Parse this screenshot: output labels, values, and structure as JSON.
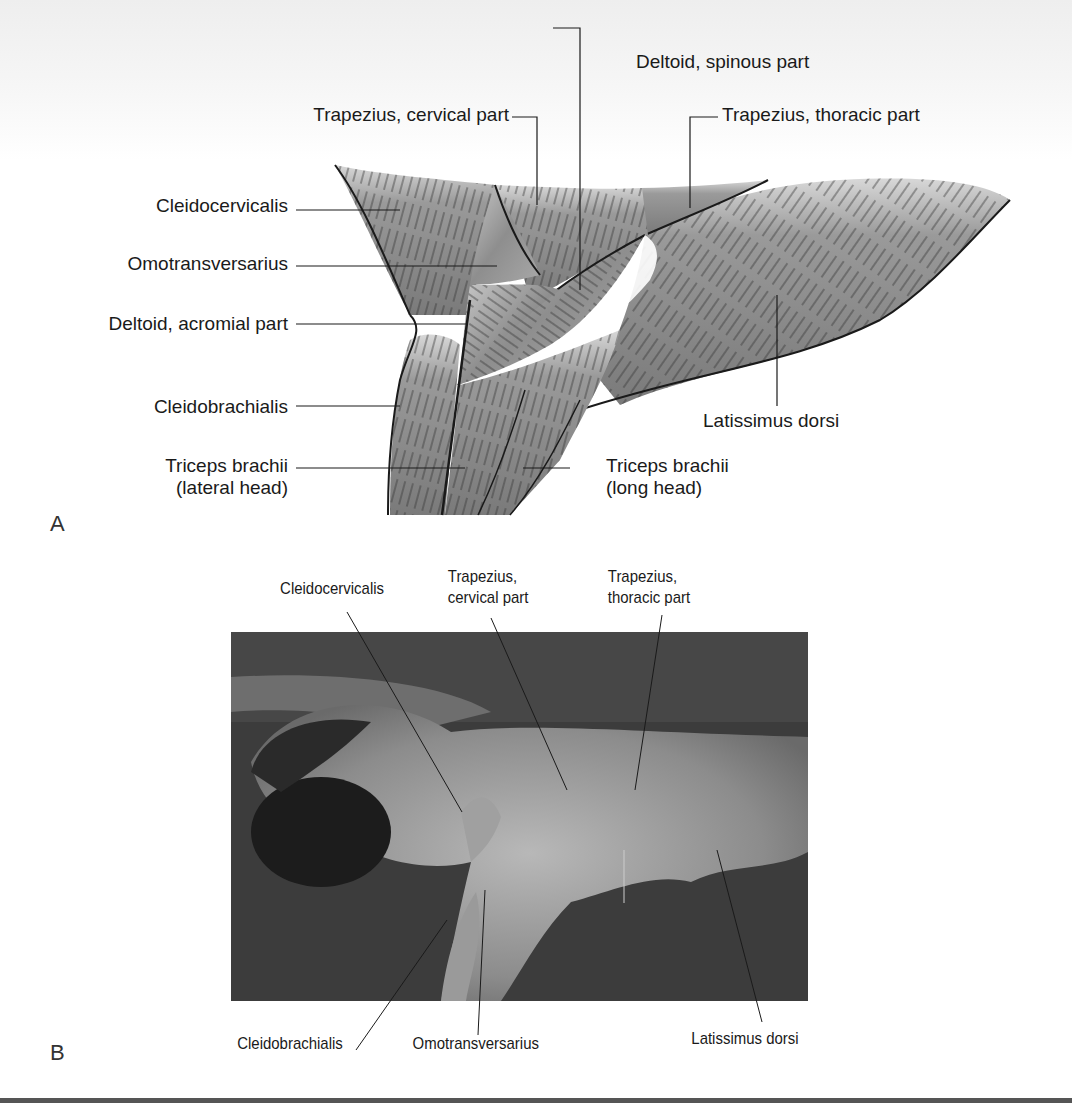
{
  "figure": {
    "panel_a": {
      "letter": "A",
      "labels": {
        "deltoid_spinous": "Deltoid, spinous part",
        "trapezius_cervical": "Trapezius, cervical part",
        "trapezius_thoracic": "Trapezius, thoracic part",
        "cleidocervicalis": "Cleidocervicalis",
        "omotransversarius": "Omotransversarius",
        "deltoid_acromial": "Deltoid, acromial part",
        "cleidobrachialis": "Cleidobrachialis",
        "latissimus_dorsi": "Latissimus dorsi",
        "triceps_lateral_1": "Triceps brachii",
        "triceps_lateral_2": "(lateral head)",
        "triceps_long_1": "Triceps brachii",
        "triceps_long_2": "(long head)"
      }
    },
    "panel_b": {
      "letter": "B",
      "labels": {
        "cleidocervicalis": "Cleidocervicalis",
        "trapezius_cervical_1": "Trapezius,",
        "trapezius_cervical_2": "cervical part",
        "trapezius_thoracic_1": "Trapezius,",
        "trapezius_thoracic_2": "thoracic part",
        "cleidobrachialis": "Cleidobrachialis",
        "omotransversarius": "Omotransversarius",
        "latissimus_dorsi": "Latissimus dorsi"
      }
    },
    "colors": {
      "muscle_fill": "#8a8a8a",
      "outline": "#1a1a1a",
      "photo_bg": "#3a3a3a",
      "rule": "#555555"
    }
  }
}
